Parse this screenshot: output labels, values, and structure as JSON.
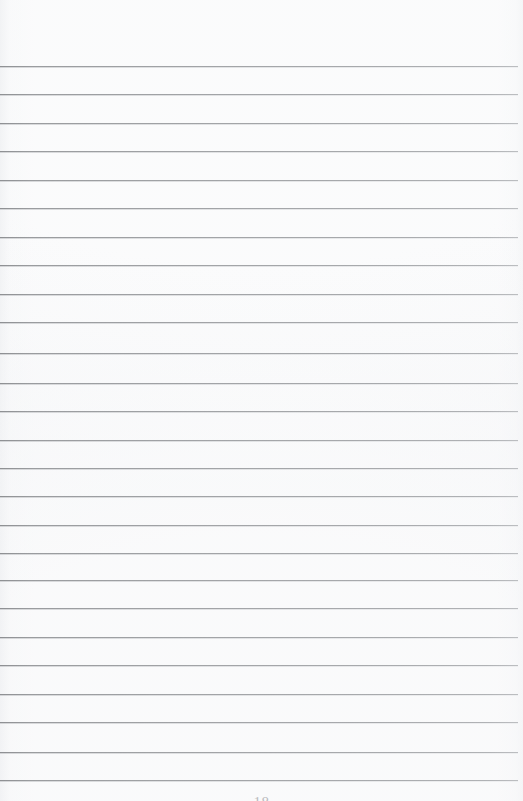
{
  "document": {
    "kind": "scanned-lined-notebook-page",
    "page_width": 523,
    "page_height": 801,
    "background_color": "#ffffff",
    "body_text": ""
  },
  "ruling": {
    "line_color": "#a2a4a7",
    "line_count": 26,
    "first_line_y": 66,
    "line_spacing": 28.5,
    "line_left_x": 0,
    "line_right_x": 518,
    "line_thickness": 1,
    "lines_y": [
      66,
      94,
      123,
      151,
      180,
      208,
      237,
      265,
      294,
      322,
      353,
      383,
      411,
      440,
      468,
      496,
      525,
      553,
      580,
      608,
      637,
      665,
      694,
      722,
      752,
      780
    ]
  },
  "footer": {
    "page_number": "18",
    "visible": "partially-cut-off-at-bottom-edge",
    "color": "#b9bbbe"
  }
}
